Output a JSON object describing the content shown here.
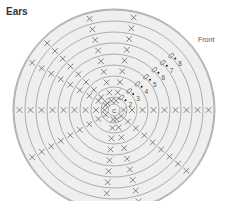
{
  "diagram": {
    "title": "Ears",
    "front_label": "Front",
    "center_label": "C",
    "round_numbers": [
      "2",
      "3",
      "4",
      "5",
      "6",
      "7",
      "8"
    ],
    "symbol_types": [
      "single-crochet-x",
      "increase-v",
      "slip-stitch-oval",
      "round-start-dot"
    ],
    "ring_count": 10,
    "colors": {
      "ring_stroke": "#9a9a9a",
      "fill": "#efefef",
      "symbol": "#555555",
      "text": "#333333"
    }
  }
}
